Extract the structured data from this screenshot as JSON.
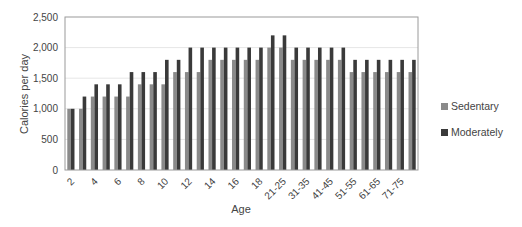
{
  "chart_data": {
    "type": "bar",
    "title": "",
    "xlabel": "Age",
    "ylabel": "Calories per day",
    "ylim": [
      0,
      2500
    ],
    "yticks": [
      0,
      500,
      1000,
      1500,
      2000,
      2500
    ],
    "ytick_labels": [
      "0",
      "500",
      "1,000",
      "1,500",
      "2,000",
      "2,500"
    ],
    "grid": true,
    "legend_position": "right",
    "categories": [
      "2",
      "3",
      "4",
      "5",
      "6",
      "7",
      "8",
      "9",
      "10",
      "11",
      "12",
      "13",
      "14",
      "15",
      "16",
      "17",
      "18",
      "19-20",
      "21-25",
      "26-30",
      "31-35",
      "36-40",
      "41-45",
      "46-50",
      "51-55",
      "56-60",
      "61-65",
      "66-70",
      "71-75",
      "76+"
    ],
    "visible_xtick_labels": [
      "2",
      "4",
      "6",
      "8",
      "10",
      "12",
      "14",
      "16",
      "18",
      "21-25",
      "31-35",
      "41-45",
      "51-55",
      "61-65",
      "71-75"
    ],
    "series": [
      {
        "name": "Sedentary",
        "color": "#8a8a8a",
        "values": [
          1000,
          1000,
          1200,
          1200,
          1200,
          1200,
          1400,
          1400,
          1400,
          1600,
          1600,
          1600,
          1800,
          1800,
          1800,
          1800,
          1800,
          2000,
          2000,
          1800,
          1800,
          1800,
          1800,
          1800,
          1600,
          1600,
          1600,
          1600,
          1600,
          1600
        ]
      },
      {
        "name": "Moderately",
        "color": "#3a3a3a",
        "values": [
          1000,
          1200,
          1400,
          1400,
          1400,
          1600,
          1600,
          1600,
          1800,
          1800,
          2000,
          2000,
          2000,
          2000,
          2000,
          2000,
          2000,
          2200,
          2200,
          2000,
          2000,
          2000,
          2000,
          2000,
          1800,
          1800,
          1800,
          1800,
          1800,
          1800
        ]
      }
    ]
  },
  "legend": {
    "items": [
      {
        "label": "Sedentary",
        "color": "#8a8a8a"
      },
      {
        "label": "Moderately",
        "color": "#3a3a3a"
      }
    ]
  }
}
